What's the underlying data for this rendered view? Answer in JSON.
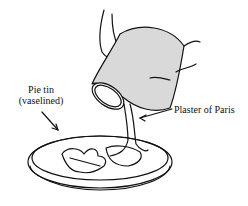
{
  "figure": {
    "type": "illustration",
    "labels": {
      "pie_tin_line1": "Pie tin",
      "pie_tin_line2": "(vaselined)",
      "plaster": "Plaster of Paris"
    },
    "colors": {
      "ink": "#111111",
      "can_fill": "#d9d9d9",
      "background": "#ffffff"
    }
  }
}
